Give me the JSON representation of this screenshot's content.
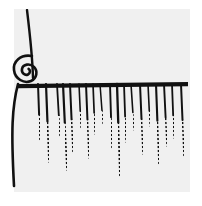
{
  "image": {
    "title": "Fringed brush edge line drawing",
    "width": 202,
    "height": 206,
    "page_background": "#ffffff",
    "panel_background": "#f0f0f0",
    "ink_color": "#111111"
  },
  "panel": {
    "x": 14,
    "y": 9,
    "width": 176,
    "height": 183
  },
  "elements": {
    "handle_label": "upright handle stroke",
    "curl_label": "rolled spiral curl",
    "crossbar_label": "horizontal bristle bar",
    "left_edge_label": "left curved edge stroke",
    "fringe_label": "hanging bristle fringe"
  },
  "handle": {
    "x1": 27,
    "y1": 10,
    "x2": 33,
    "y2": 60,
    "x3": 33,
    "y3": 78,
    "width": 2.4
  },
  "crossbar": {
    "x1": 18,
    "y1": 82,
    "x2": 188,
    "y2": 80,
    "thickness": 4.2
  },
  "curl": {
    "cx": 24,
    "cy": 66,
    "outer_rx": 11,
    "outer_ry": 13,
    "inner_rx": 5,
    "inner_ry": 6,
    "stroke": 2.6
  },
  "left_edge": {
    "x1": 18,
    "y1": 84,
    "cx": 12,
    "cy": 130,
    "x2": 14,
    "y2": 186,
    "width": 2.6
  },
  "fringe": {
    "top_y": 84,
    "count": 19,
    "strands": [
      {
        "x": 38,
        "dx": 2,
        "len": 56,
        "w": 2.0,
        "fade": 0.55
      },
      {
        "x": 46,
        "dx": 3,
        "len": 78,
        "w": 2.2,
        "fade": 0.48
      },
      {
        "x": 57,
        "dx": 3,
        "len": 52,
        "w": 1.8,
        "fade": 0.6
      },
      {
        "x": 63,
        "dx": 4,
        "len": 86,
        "w": 2.2,
        "fade": 0.45
      },
      {
        "x": 70,
        "dx": 3,
        "len": 68,
        "w": 2.0,
        "fade": 0.52
      },
      {
        "x": 79,
        "dx": 2,
        "len": 44,
        "w": 1.6,
        "fade": 0.62
      },
      {
        "x": 86,
        "dx": 3,
        "len": 74,
        "w": 2.0,
        "fade": 0.48
      },
      {
        "x": 93,
        "dx": 2,
        "len": 50,
        "w": 1.7,
        "fade": 0.58
      },
      {
        "x": 100,
        "dx": 3,
        "len": 40,
        "w": 1.5,
        "fade": 0.66
      },
      {
        "x": 110,
        "dx": 2,
        "len": 64,
        "w": 1.9,
        "fade": 0.52
      },
      {
        "x": 117,
        "dx": 3,
        "len": 92,
        "w": 2.3,
        "fade": 0.42
      },
      {
        "x": 124,
        "dx": 2,
        "len": 58,
        "w": 1.8,
        "fade": 0.56
      },
      {
        "x": 131,
        "dx": 3,
        "len": 46,
        "w": 1.6,
        "fade": 0.62
      },
      {
        "x": 140,
        "dx": 3,
        "len": 70,
        "w": 2.0,
        "fade": 0.5
      },
      {
        "x": 148,
        "dx": 2,
        "len": 42,
        "w": 1.6,
        "fade": 0.64
      },
      {
        "x": 156,
        "dx": 3,
        "len": 80,
        "w": 2.1,
        "fade": 0.46
      },
      {
        "x": 164,
        "dx": 3,
        "len": 62,
        "w": 1.9,
        "fade": 0.54
      },
      {
        "x": 172,
        "dx": 2,
        "len": 54,
        "w": 1.8,
        "fade": 0.58
      },
      {
        "x": 181,
        "dx": 3,
        "len": 72,
        "w": 2.0,
        "fade": 0.5
      }
    ]
  }
}
